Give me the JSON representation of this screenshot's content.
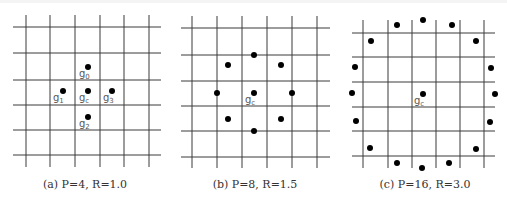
{
  "figure": {
    "panels": [
      {
        "id": "a",
        "caption": "(a) P=4, R=1.0",
        "P": 4,
        "R": 1.0,
        "grid": {
          "x": [
            26,
            50,
            75,
            100,
            124,
            149
          ],
          "y": [
            27,
            53,
            80,
            105,
            130,
            155
          ],
          "xmin": 13,
          "xmax": 161,
          "ymin": 15,
          "ymax": 167
        },
        "center": {
          "x": 88,
          "y": 91,
          "label": "g",
          "sub": "c"
        },
        "points": [
          {
            "x": 88,
            "y": 67,
            "label": "g",
            "sub": "0",
            "lx": 79,
            "ly": 77
          },
          {
            "x": 63,
            "y": 91,
            "label": "g",
            "sub": "1",
            "lx": 53,
            "ly": 101
          },
          {
            "x": 88,
            "y": 117,
            "label": "g",
            "sub": "2",
            "lx": 79,
            "ly": 127
          },
          {
            "x": 112,
            "y": 91,
            "label": "g",
            "sub": "3",
            "lx": 103,
            "ly": 101
          }
        ],
        "center_label_pos": {
          "lx": 79,
          "ly": 101
        },
        "caption_x": 85,
        "caption_y": 178
      },
      {
        "id": "b",
        "caption": "(b) P=8, R=1.5",
        "P": 8,
        "R": 1.5,
        "grid": {
          "x": [
            192,
            217,
            242,
            267,
            292,
            317
          ],
          "y": [
            28,
            55,
            81,
            106,
            131,
            157
          ],
          "xmin": 181,
          "xmax": 330,
          "ymin": 16,
          "ymax": 168
        },
        "center": {
          "x": 254,
          "y": 93,
          "label": "g",
          "sub": "c"
        },
        "points": [
          {
            "x": 254,
            "y": 55
          },
          {
            "x": 228,
            "y": 65
          },
          {
            "x": 281,
            "y": 65
          },
          {
            "x": 217,
            "y": 93
          },
          {
            "x": 292,
            "y": 93
          },
          {
            "x": 228,
            "y": 119
          },
          {
            "x": 281,
            "y": 119
          },
          {
            "x": 254,
            "y": 131
          }
        ],
        "center_label_pos": {
          "lx": 245,
          "ly": 103
        },
        "caption_x": 255,
        "caption_y": 178
      },
      {
        "id": "c",
        "caption": "(c) P=16, R=3.0",
        "P": 16,
        "R": 3.0,
        "grid": {
          "x": [
            363,
            388,
            412,
            436,
            460,
            484
          ],
          "y": [
            33,
            57,
            82,
            107,
            131,
            156
          ],
          "xmin": 352,
          "xmax": 495,
          "ymin": 20,
          "ymax": 168
        },
        "center": {
          "x": 423,
          "y": 94,
          "label": "g",
          "sub": "c"
        },
        "points": [
          {
            "x": 423,
            "y": 20
          },
          {
            "x": 452,
            "y": 25
          },
          {
            "x": 476,
            "y": 41
          },
          {
            "x": 491,
            "y": 68
          },
          {
            "x": 495,
            "y": 94
          },
          {
            "x": 490,
            "y": 122
          },
          {
            "x": 476,
            "y": 149
          },
          {
            "x": 449,
            "y": 163
          },
          {
            "x": 422,
            "y": 168
          },
          {
            "x": 397,
            "y": 163
          },
          {
            "x": 370,
            "y": 148
          },
          {
            "x": 356,
            "y": 121
          },
          {
            "x": 352,
            "y": 93
          },
          {
            "x": 355,
            "y": 67
          },
          {
            "x": 371,
            "y": 41
          },
          {
            "x": 397,
            "y": 25
          }
        ],
        "center_label_pos": {
          "lx": 414,
          "ly": 104
        },
        "caption_x": 425,
        "caption_y": 178
      }
    ]
  }
}
